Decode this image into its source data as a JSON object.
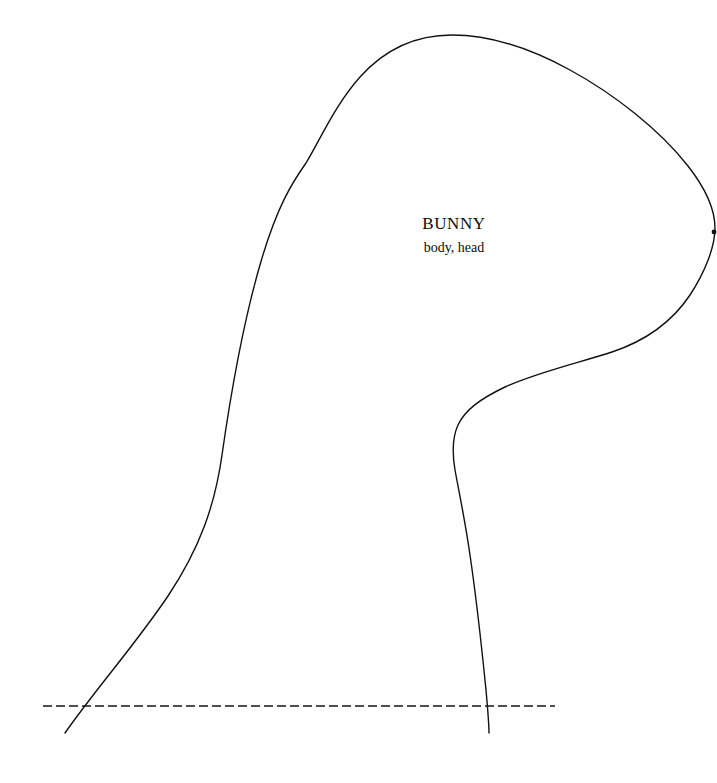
{
  "document": {
    "type": "sewing-pattern-template",
    "background_color": "#ffffff",
    "width": 717,
    "height": 783
  },
  "pattern": {
    "title": "BUNNY",
    "subtitle": "body, head",
    "stroke_color": "#111111",
    "stroke_width": 1.4,
    "fill": "none"
  },
  "fold_line": {
    "name": "place-on-fold-line",
    "style": "dashed",
    "stroke_color": "#141414",
    "stroke_width": 1.6,
    "dash_length": 9,
    "gap_length": 4,
    "x_start": 43,
    "x_end": 555,
    "y": 706
  },
  "geometry": {
    "outline_path": "M 65 733 C 95 690 135 645 168 596 C 200 548 215 505 222 455 C 231 392 244 318 262 258 C 278 205 292 183 306 163 C 320 140 335 105 360 77 C 386 48 418 35 452 35 C 490 35 530 48 570 70 C 614 94 660 130 688 166 C 706 189 715 210 715 228 C 715 247 705 272 690 295 C 672 322 645 341 612 352 C 578 363 535 373 505 387 C 480 399 465 410 458 425 C 452 438 452 452 455 470 C 459 492 465 520 470 555 C 476 596 482 650 486 690 C 488 712 489 726 489 733",
    "right_leg_end": {
      "x": 489,
      "y": 733
    },
    "left_leg_end": {
      "x": 65,
      "y": 733
    },
    "rightmost_point": {
      "x": 715,
      "y": 228
    },
    "topmost_point": {
      "x": 452,
      "y": 35
    },
    "notch_marker": {
      "x": 714,
      "y": 232,
      "r": 2.4
    }
  }
}
